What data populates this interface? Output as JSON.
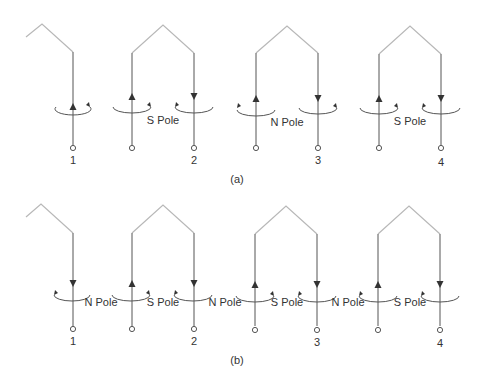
{
  "colors": {
    "wire_top": "#b8b8b8",
    "wire": "#555555",
    "text": "#333333",
    "background": "#ffffff"
  },
  "diagrams": [
    {
      "caption": "(a)",
      "coil_numbers": [
        "1",
        "2",
        "3",
        "4"
      ],
      "pole_labels": [
        "S Pole",
        "N Pole",
        "S Pole"
      ]
    },
    {
      "caption": "(b)",
      "coil_numbers": [
        "1",
        "2",
        "3",
        "4"
      ],
      "pole_labels": [
        "N Pole",
        "S Pole",
        "N Pole",
        "S Pole",
        "N Pole",
        "S Pole"
      ]
    }
  ]
}
